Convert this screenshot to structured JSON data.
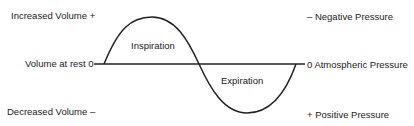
{
  "diagram": {
    "left_labels": {
      "increased": "Increased Volume +",
      "rest": "Volume at rest 0",
      "decreased": "Decreased Volume –"
    },
    "right_labels": {
      "negative": "– Negative Pressure",
      "atmospheric": "0 Atmospheric Pressure",
      "positive": "+ Positive Pressure"
    },
    "curve_labels": {
      "upper": "Inspiration",
      "lower": "Expiration"
    },
    "colors": {
      "line": "#222222",
      "text": "#222222",
      "background": "#ffffff"
    }
  }
}
